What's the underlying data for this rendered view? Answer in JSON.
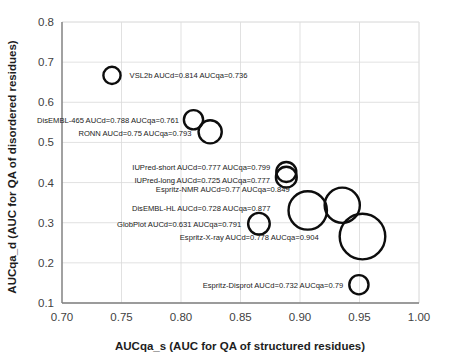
{
  "chart_data": {
    "type": "scatter",
    "title": "",
    "xlabel": "AUCqa_s (AUC for QA of structured residues)",
    "ylabel": "AUCqa_d (AUC for QA of disordered residues)",
    "xlim": [
      0.7,
      1.0
    ],
    "ylim": [
      0.1,
      0.8
    ],
    "xticks": [
      "0.70",
      "0.75",
      "0.80",
      "0.85",
      "0.90",
      "0.95",
      "1.00"
    ],
    "xtick_values": [
      0.7,
      0.75,
      0.8,
      0.85,
      0.9,
      0.95,
      1.0
    ],
    "yticks": [
      "0.1",
      "0.2",
      "0.3",
      "0.4",
      "0.5",
      "0.6",
      "0.7",
      "0.8"
    ],
    "ytick_values": [
      0.1,
      0.2,
      0.3,
      0.4,
      0.5,
      0.6,
      0.7,
      0.8
    ],
    "grid": true,
    "legend": "none",
    "marker_style": "open-circle",
    "size_encodes": "AUCd",
    "points": [
      {
        "name": "VSL2b",
        "label": "VSL2b   AUCd=0.814 AUCqa=0.736",
        "x": 0.742,
        "y": 0.667,
        "aucd": 0.814,
        "aucqa": 0.736,
        "r": 8.6,
        "label_anchor": "start",
        "label_dx": 9,
        "label_dy": 3
      },
      {
        "name": "DisEMBL-465",
        "label": "DisEMBL-465 AUCd=0.788 AUCqa=0.761",
        "x": 0.8105,
        "y": 0.5565,
        "aucd": 0.788,
        "aucqa": 0.761,
        "r": 9.6,
        "label_anchor": "end",
        "label_dx": -5,
        "label_dy": 3
      },
      {
        "name": "RONN",
        "label": "RONN AUCd=0.75 AUCqa=0.793",
        "x": 0.8245,
        "y": 0.5265,
        "aucd": 0.75,
        "aucqa": 0.793,
        "r": 11.6,
        "label_anchor": "end",
        "label_dx": -7,
        "label_dy": 4
      },
      {
        "name": "IUPred-short",
        "label": "IUPred-short AUCd=0.777 AUCqa=0.799",
        "x": 0.8885,
        "y": 0.4265,
        "aucd": 0.777,
        "aucqa": 0.799,
        "r": 10.0,
        "label_anchor": "end",
        "label_dx": -6,
        "label_dy": -2
      },
      {
        "name": "IUPred-long",
        "label": "IUPred-long AUCd=0.725 AUCqa=0.777",
        "x": 0.8885,
        "y": 0.4135,
        "aucd": 0.725,
        "aucqa": 0.777,
        "r": 10.4,
        "label_anchor": "end",
        "label_dx": -6,
        "label_dy": 6
      },
      {
        "name": "Espritz-NMR",
        "label": "Espritz-NMR AUCd=0.77 AUCqa=0.849",
        "x": 0.9355,
        "y": 0.3435,
        "aucd": 0.77,
        "aucqa": 0.849,
        "r": 17.6,
        "label_anchor": "end",
        "label_dx": -35,
        "label_dy": -13
      },
      {
        "name": "DisEMBL-HL",
        "label": "DisEMBL-HL AUCd=0.728 AUCqa=0.877",
        "x": 0.9065,
        "y": 0.3305,
        "aucd": 0.728,
        "aucqa": 0.877,
        "r": 19.2,
        "label_anchor": "end",
        "label_dx": -18,
        "label_dy": 1
      },
      {
        "name": "GlobPlot",
        "label": "GlobPlot  AUCd=0.631 AUCqa=0.791",
        "x": 0.8655,
        "y": 0.2975,
        "aucd": 0.631,
        "aucqa": 0.791,
        "r": 10.8,
        "label_anchor": "end",
        "label_dx": -7,
        "label_dy": 3
      },
      {
        "name": "Espritz-X-ray",
        "label": "Espritz-X-ray AUCd=0.778 AUCqa=0.904",
        "x": 0.9525,
        "y": 0.2655,
        "aucd": 0.778,
        "aucqa": 0.904,
        "r": 22.8,
        "label_anchor": "end",
        "label_dx": -21,
        "label_dy": 3
      },
      {
        "name": "Espritz-Disprot",
        "label": "Espritz-Disprot AUCd=0.732 AUCqa=0.79",
        "x": 0.9495,
        "y": 0.1455,
        "aucd": 0.732,
        "aucqa": 0.79,
        "r": 9.6,
        "label_anchor": "end",
        "label_dx": -6,
        "label_dy": 3
      }
    ]
  }
}
